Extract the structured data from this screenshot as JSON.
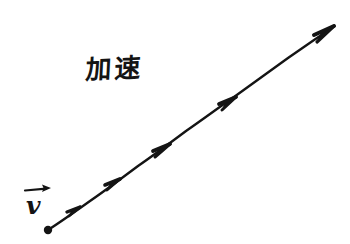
{
  "figure": {
    "title_text": "加速",
    "background_color": "#ffffff",
    "ink_color": "#141414",
    "width": 350,
    "height": 244,
    "style": "hand-drawn physics sketch"
  },
  "labels": {
    "acceleration": {
      "text": "加速",
      "meaning": "acceleration",
      "x": 86,
      "y": 57
    },
    "velocity": {
      "text": "v",
      "accent": "vector-arrow-overbar",
      "x": 26,
      "y": 193
    }
  },
  "diagram": {
    "type": "vector-motion-line",
    "origin_dot": {
      "x": 48,
      "y": 230,
      "radius": 4.2
    },
    "line": {
      "start": {
        "x": 48,
        "y": 230
      },
      "end": {
        "x": 332,
        "y": 28
      },
      "stroke_width": 2.4,
      "color": "#141414"
    },
    "arrowheads": [
      {
        "x": 78,
        "y": 209,
        "angle": -35.4,
        "size": 11
      },
      {
        "x": 117,
        "y": 181,
        "angle": -35.4,
        "size": 12
      },
      {
        "x": 166,
        "y": 147,
        "angle": -35.4,
        "size": 13
      },
      {
        "x": 232,
        "y": 100,
        "angle": -35.4,
        "size": 13
      },
      {
        "x": 332,
        "y": 28,
        "angle": -35.4,
        "size": 16
      }
    ],
    "velocity_arrow_overbar": {
      "start": {
        "x": 25,
        "y": 190
      },
      "end": {
        "x": 50,
        "y": 188
      },
      "stroke_width": 2.2
    }
  }
}
